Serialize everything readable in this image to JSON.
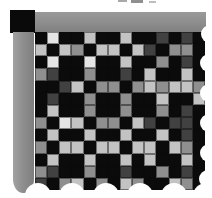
{
  "figure": {
    "kind": "mosaic-texture-swatch-with-torn-edges",
    "grid_rows": 13,
    "grid_columns": 14
  },
  "palette": {
    "background": "#ffffff",
    "corner_black": "#0a0a0a",
    "bar_gray": "#8e8e8e",
    "black": "#0b0b0b",
    "dark_gray": "#414141",
    "medium_gray": "#8f8f8f",
    "light_gray": "#c3c3c3",
    "near_white": "#e5e5e5"
  },
  "mosaic": {
    "legend": {
      "K": "black",
      "D": "dark_gray",
      "M": "medium_gray",
      "L": "light_gray",
      "W": "near_white"
    },
    "cells": [
      [
        "K",
        "W",
        "K",
        "K",
        "L",
        "K",
        "K",
        "L",
        "K",
        "K",
        "D",
        "K",
        "D",
        "K"
      ],
      [
        "L",
        "K",
        "L",
        "M",
        "K",
        "L",
        "L",
        "K",
        "L",
        "D",
        "K",
        "M",
        "M",
        "K"
      ],
      [
        "K",
        "W",
        "K",
        "K",
        "W",
        "K",
        "K",
        "L",
        "K",
        "K",
        "M",
        "K",
        "D",
        "K"
      ],
      [
        "M",
        "D",
        "K",
        "K",
        "M",
        "K",
        "K",
        "D",
        "K",
        "L",
        "K",
        "K",
        "L",
        "K"
      ],
      [
        "K",
        "K",
        "D",
        "L",
        "K",
        "M",
        "M",
        "K",
        "M",
        "L",
        "M",
        "L",
        "L",
        "M"
      ],
      [
        "K",
        "D",
        "K",
        "K",
        "M",
        "K",
        "K",
        "M",
        "K",
        "K",
        "L",
        "K",
        "K",
        "L"
      ],
      [
        "K",
        "L",
        "K",
        "K",
        "M",
        "K",
        "K",
        "M",
        "K",
        "K",
        "M",
        "K",
        "D",
        "K"
      ],
      [
        "M",
        "K",
        "W",
        "L",
        "K",
        "M",
        "M",
        "K",
        "L",
        "D",
        "K",
        "D",
        "D",
        "K"
      ],
      [
        "K",
        "L",
        "K",
        "K",
        "L",
        "K",
        "K",
        "L",
        "K",
        "K",
        "L",
        "K",
        "D",
        "K"
      ],
      [
        "M",
        "K",
        "L",
        "L",
        "K",
        "L",
        "L",
        "K",
        "L",
        "L",
        "K",
        "L",
        "M",
        "K"
      ],
      [
        "K",
        "L",
        "K",
        "K",
        "L",
        "K",
        "K",
        "L",
        "K",
        "L",
        "K",
        "K",
        "L",
        "K"
      ],
      [
        "M",
        "D",
        "K",
        "K",
        "M",
        "K",
        "K",
        "D",
        "K",
        "K",
        "M",
        "K",
        "D",
        "K"
      ],
      [
        "D",
        "K",
        "M",
        "L",
        "K",
        "M",
        "K",
        "L",
        "M",
        "K",
        "K",
        "L",
        "M",
        "K"
      ]
    ]
  }
}
